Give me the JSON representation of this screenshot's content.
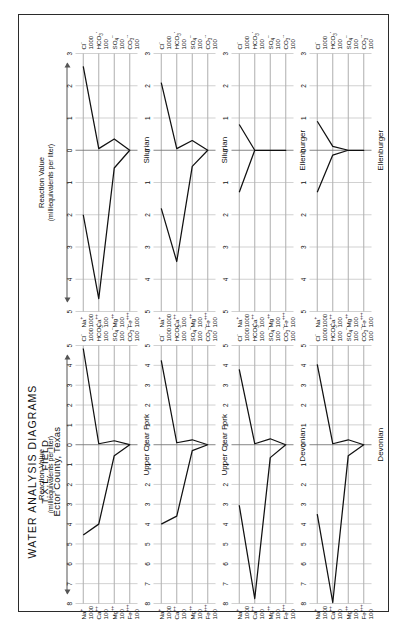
{
  "title": {
    "line1": "WATER ANALYSIS DIAGRAMS",
    "line2": "T.X.L. FIELD",
    "line3": "Ector County, Texas"
  },
  "axis_caption": {
    "line1": "Reaction Value",
    "line2": "(milliequivalents per liter)"
  },
  "cation_labels": [
    {
      "ion": "Na",
      "charge": "+",
      "scale": "1000"
    },
    {
      "ion": "Ca",
      "charge": "++",
      "scale": "100"
    },
    {
      "ion": "Mg",
      "charge": "++",
      "scale": "100"
    },
    {
      "ion": "Fe",
      "charge": "+++",
      "scale": "100"
    }
  ],
  "anion_labels": [
    {
      "ion": "Cl",
      "sub": "",
      "charge": "-",
      "scale": "1000"
    },
    {
      "ion": "HCO",
      "sub": "3",
      "charge": "-",
      "scale": "100"
    },
    {
      "ion": "SO",
      "sub": "4",
      "charge": "--",
      "scale": "100"
    },
    {
      "ion": "CO",
      "sub": "3",
      "charge": "--",
      "scale": "100"
    }
  ],
  "chart_data": {
    "type": "line",
    "xlabel": "Reaction Value (milliequivalents per liter)",
    "ylabel": "",
    "grid": true,
    "legend": "none",
    "note": "Stiff diagrams. Each panel: 4 horizontal ion axes (Na/Cl, Ca/HCO3, Mg/SO4, Fe/CO3). Cation values plotted left of the zero axis, anion values right. Values are reaction values in milliequivalents per liter.",
    "columns": [
      {
        "name": "left-column",
        "cation_axis_max": 8,
        "anion_axis_max": 5,
        "cation_ticks": [
          8,
          7,
          6,
          5,
          4,
          3,
          2,
          1,
          0
        ],
        "anion_ticks": [
          0,
          1,
          2,
          3,
          4,
          5
        ]
      },
      {
        "name": "right-column",
        "cation_axis_max": 5,
        "anion_axis_max": 3,
        "cation_ticks": [
          5,
          4,
          3,
          2,
          1,
          0
        ],
        "anion_ticks": [
          0,
          1,
          2,
          3
        ]
      }
    ],
    "panels": [
      {
        "id": "panel-1",
        "formation": "Upper Clear Fork",
        "column": "left",
        "row": 1,
        "cations": {
          "Na": 4.55,
          "Ca": 4.0,
          "Mg": 0.55,
          "Fe": 0.0
        },
        "anions": {
          "Cl": 4.85,
          "HCO3": 0.05,
          "SO4": 0.2,
          "CO3": 0.0
        }
      },
      {
        "id": "panel-2",
        "formation": "Upper Clear Fork",
        "column": "left",
        "row": 2,
        "cations": {
          "Na": 4.0,
          "Ca": 3.6,
          "Mg": 0.3,
          "Fe": 0.0
        },
        "anions": {
          "Cl": 4.25,
          "HCO3": 0.1,
          "SO4": 0.25,
          "CO3": 0.0
        }
      },
      {
        "id": "panel-3",
        "formation": "Devonian",
        "column": "left",
        "row": 3,
        "cations": {
          "Na": 3.05,
          "Ca": 7.75,
          "Mg": 0.65,
          "Fe": 0.0
        },
        "anions": {
          "Cl": 3.8,
          "HCO3": 0.05,
          "SO4": 0.3,
          "CO3": 0.0
        }
      },
      {
        "id": "panel-4",
        "formation": "Devonian",
        "column": "left",
        "row": 4,
        "cations": {
          "Na": 3.5,
          "Ca": 7.95,
          "Mg": 0.55,
          "Fe": 0.0
        },
        "anions": {
          "Cl": 4.05,
          "HCO3": 0.05,
          "SO4": 0.25,
          "CO3": 0.0
        }
      },
      {
        "id": "panel-5",
        "formation": "Silurian",
        "column": "right",
        "row": 1,
        "cations": {
          "Na": 2.0,
          "Ca": 4.6,
          "Mg": 0.55,
          "Fe": 0.0
        },
        "anions": {
          "Cl": 2.6,
          "HCO3": 0.05,
          "SO4": 0.35,
          "CO3": 0.0
        }
      },
      {
        "id": "panel-6",
        "formation": "Silurian",
        "column": "right",
        "row": 2,
        "cations": {
          "Na": 1.8,
          "Ca": 3.45,
          "Mg": 0.5,
          "Fe": 0.0
        },
        "anions": {
          "Cl": 2.1,
          "HCO3": 0.05,
          "SO4": 0.3,
          "CO3": 0.0
        }
      },
      {
        "id": "panel-7",
        "formation": "Ellenburger",
        "column": "right",
        "row": 3,
        "cations": {
          "Na": 1.3,
          "Ca": 0.0,
          "Mg": 0.0,
          "Fe": 0.0
        },
        "anions": {
          "Cl": 0.8,
          "HCO3": 0.0,
          "SO4": 0.0,
          "CO3": 0.0
        }
      },
      {
        "id": "panel-8",
        "formation": "Ellenburger",
        "column": "right",
        "row": 4,
        "cations": {
          "Na": 1.3,
          "Ca": 0.15,
          "Mg": 0.0,
          "Fe": 0.0
        },
        "anions": {
          "Cl": 0.9,
          "HCO3": 0.12,
          "SO4": 0.0,
          "CO3": 0.0
        }
      }
    ]
  }
}
